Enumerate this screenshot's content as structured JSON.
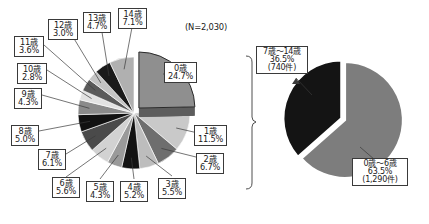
{
  "figure": {
    "sample_note": "(N=2,030)",
    "background_color": "#ffffff"
  },
  "chart_data": [
    {
      "id": "age-breakdown-pie",
      "type": "pie",
      "title": "",
      "subtitle": "(N=2,030)",
      "total_label": "N=2,030",
      "total": 2030,
      "unit": "%",
      "legend_position": "callouts",
      "exploded_slice": "0歳",
      "categories": [
        "0歳",
        "1歳",
        "2歳",
        "3歳",
        "4歳",
        "5歳",
        "6歳",
        "7歳",
        "8歳",
        "9歳",
        "10歳",
        "11歳",
        "12歳",
        "13歳",
        "14歳"
      ],
      "values": [
        24.7,
        11.5,
        6.7,
        5.5,
        5.2,
        4.3,
        5.6,
        6.1,
        5.0,
        4.3,
        2.8,
        3.6,
        3.0,
        4.7,
        7.1
      ],
      "value_labels": [
        "24.7%",
        "11.5%",
        "6.7%",
        "5.5%",
        "5.2%",
        "4.3%",
        "5.6%",
        "6.1%",
        "5.0%",
        "4.3%",
        "2.8%",
        "3.6%",
        "3.0%",
        "4.7%",
        "7.1%"
      ],
      "colors": [
        "#8f8f8f",
        "#c9c9c9",
        "#6e6e6e",
        "#bdbdbd",
        "#131313",
        "#9a9a9a",
        "#d2d2d2",
        "#4a4a4a",
        "#111111",
        "#8a8a8a",
        "#e2e2e2",
        "#5a5a5a",
        "#c4c4c4",
        "#1a1a1a",
        "#b0b0b0"
      ]
    },
    {
      "id": "age-group-pie",
      "type": "pie",
      "title": "",
      "categories": [
        "0歳～6歳",
        "7歳～14歳"
      ],
      "values": [
        63.5,
        36.5
      ],
      "value_labels": [
        "63.5%",
        "36.5%"
      ],
      "counts": [
        1290,
        740
      ],
      "count_labels": [
        "(1,290件)",
        "(740件)"
      ],
      "colors": [
        "#7d7d7d",
        "#141414"
      ],
      "legend_position": "callouts"
    }
  ],
  "left_pie_callouts": [
    {
      "name": "slice-label-0",
      "lines": [
        "0歳",
        "24.7%"
      ]
    },
    {
      "name": "slice-label-1",
      "lines": [
        "1歳",
        "11.5%"
      ]
    },
    {
      "name": "slice-label-2",
      "lines": [
        "2歳",
        "6.7%"
      ]
    },
    {
      "name": "slice-label-3",
      "lines": [
        "3歳",
        "5.5%"
      ]
    },
    {
      "name": "slice-label-4",
      "lines": [
        "4歳",
        "5.2%"
      ]
    },
    {
      "name": "slice-label-5",
      "lines": [
        "5歳",
        "4.3%"
      ]
    },
    {
      "name": "slice-label-6",
      "lines": [
        "6歳",
        "5.6%"
      ]
    },
    {
      "name": "slice-label-7",
      "lines": [
        "7歳",
        "6.1%"
      ]
    },
    {
      "name": "slice-label-8",
      "lines": [
        "8歳",
        "5.0%"
      ]
    },
    {
      "name": "slice-label-9",
      "lines": [
        "9歳",
        "4.3%"
      ]
    },
    {
      "name": "slice-label-10",
      "lines": [
        "10歳",
        "2.8%"
      ]
    },
    {
      "name": "slice-label-11",
      "lines": [
        "11歳",
        "3.6%"
      ]
    },
    {
      "name": "slice-label-12",
      "lines": [
        "12歳",
        "3.0%"
      ]
    },
    {
      "name": "slice-label-13",
      "lines": [
        "13歳",
        "4.7%"
      ]
    },
    {
      "name": "slice-label-14",
      "lines": [
        "14歳",
        "7.1%"
      ]
    }
  ],
  "labels": {
    "age0": "0歳",
    "pct0": "24.7%",
    "age1": "1歳",
    "pct1": "11.5%",
    "age2": "2歳",
    "pct2": "6.7%",
    "age3": "3歳",
    "pct3": "5.5%",
    "age4": "4歳",
    "pct4": "5.2%",
    "age5": "5歳",
    "pct5": "4.3%",
    "age6": "6歳",
    "pct6": "5.6%",
    "age7": "7歳",
    "pct7": "6.1%",
    "age8": "8歳",
    "pct8": "5.0%",
    "age9": "9歳",
    "pct9": "4.3%",
    "age10": "10歳",
    "pct10": "2.8%",
    "age11": "11歳",
    "pct11": "3.6%",
    "age12": "12歳",
    "pct12": "3.0%",
    "age13": "13歳",
    "pct13": "4.7%",
    "age14": "14歳",
    "pct14": "7.1%",
    "note": "(N=2,030)",
    "group_young_name": "0歳～6歳",
    "group_young_pct": "63.5%",
    "group_young_count": "(1,290件)",
    "group_old_name": "7歳～14歳",
    "group_old_pct": "36.5%",
    "group_old_count": "(740件)"
  }
}
